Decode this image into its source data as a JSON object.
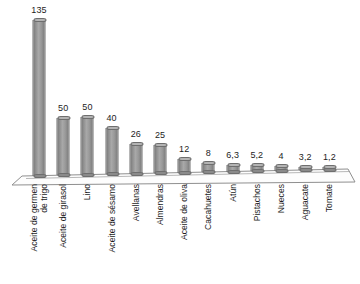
{
  "chart_data": {
    "type": "bar",
    "title": "",
    "subtitle": "",
    "xlabel": "",
    "ylabel": "",
    "grid": false,
    "legend": false,
    "axis_visible": false,
    "ylim": [
      0,
      135
    ],
    "style": "3d-bar",
    "categories": [
      "Aceite de germen de trigo",
      "Aceite de girasol",
      "Lino",
      "Aceite de sésamo",
      "Avellanas",
      "Almendras",
      "Aceite de oliva",
      "Cacahuetes",
      "Atún",
      "Pistachos",
      "Nueces",
      "Aguacate",
      "Tomate"
    ],
    "category_lines": [
      [
        "Aceite de germen",
        "de trigo"
      ],
      [
        "Aceite de girasol"
      ],
      [
        "Lino"
      ],
      [
        "Aceite de sésamo"
      ],
      [
        "Avellanas"
      ],
      [
        "Almendras"
      ],
      [
        "Aceite de oliva"
      ],
      [
        "Cacahuetes"
      ],
      [
        "Atún"
      ],
      [
        "Pistachos"
      ],
      [
        "Nueces"
      ],
      [
        "Aguacate"
      ],
      [
        "Tomate"
      ]
    ],
    "values": [
      135,
      50,
      50,
      40,
      26,
      25,
      12,
      8,
      6.3,
      5.2,
      4,
      3.2,
      1.2
    ],
    "value_labels": [
      "135",
      "50",
      "50",
      "40",
      "26",
      "25",
      "12",
      "8",
      "6,3",
      "5,2",
      "4",
      "3,2",
      "1,2"
    ],
    "colors": {
      "bar_fill": "#9a9a9a",
      "bar_edge": "#6e6e6e",
      "bar_top": "#b4b4b4",
      "floor_fill": "#fdfdfd",
      "floor_edge": "#8f8f8f",
      "background": "#ffffff",
      "text": "#1d1d1d"
    }
  }
}
